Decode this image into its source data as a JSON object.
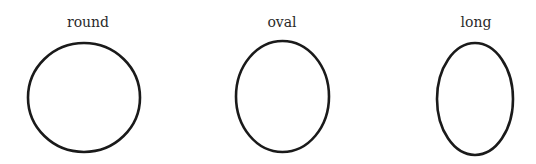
{
  "diagram": {
    "title": "",
    "stroke_color": "#1a1a1a",
    "shapes": [
      {
        "label": "round",
        "cx": 84,
        "cy": 97.5,
        "rx": 56,
        "ry": 54.5,
        "label_x": 88,
        "label_y": 22
      },
      {
        "label": "oval",
        "cx": 282.5,
        "cy": 96.5,
        "rx": 46.5,
        "ry": 55.5,
        "label_x": 282,
        "label_y": 22
      },
      {
        "label": "long",
        "cx": 475,
        "cy": 99,
        "rx": 38,
        "ry": 56,
        "label_x": 476,
        "label_y": 22
      }
    ]
  }
}
